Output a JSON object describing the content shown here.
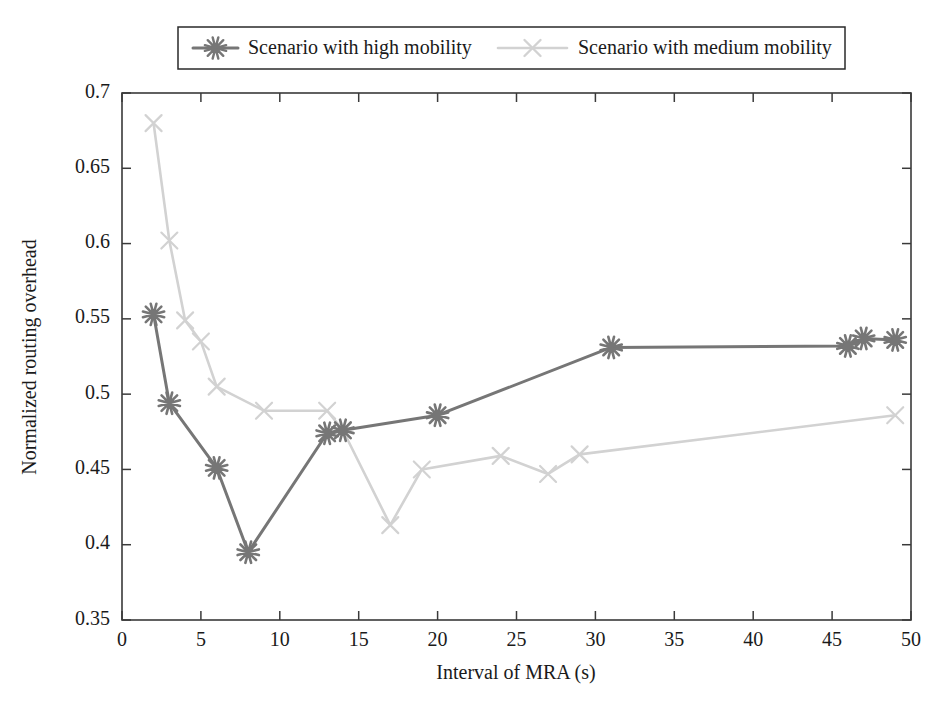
{
  "chart_data": {
    "type": "line",
    "title": "",
    "xlabel": "Interval of MRA (s)",
    "ylabel": "Normalized routing overhead",
    "xlim": [
      0,
      50
    ],
    "ylim": [
      0.35,
      0.7
    ],
    "xticks": [
      0,
      5,
      10,
      15,
      20,
      25,
      30,
      35,
      40,
      45,
      50
    ],
    "xtick_labels": [
      "0",
      "5",
      "10",
      "15",
      "20",
      "25",
      "30",
      "35",
      "40",
      "45",
      "50"
    ],
    "yticks": [
      0.35,
      0.4,
      0.45,
      0.5,
      0.55,
      0.6,
      0.65,
      0.7
    ],
    "ytick_labels": [
      "0.35",
      "0.4",
      "0.45",
      "0.5",
      "0.55",
      "0.6",
      "0.65",
      "0.7"
    ],
    "grid": false,
    "legend_position": "top-center",
    "series": [
      {
        "name": "Scenario with high mobility",
        "color": "#767676",
        "marker": "asterisk",
        "line_width": 3.0,
        "x": [
          2,
          3,
          6,
          8,
          13,
          14,
          20,
          31,
          46,
          47,
          49
        ],
        "y": [
          0.553,
          0.494,
          0.451,
          0.395,
          0.474,
          0.476,
          0.486,
          0.531,
          0.532,
          0.537,
          0.536
        ]
      },
      {
        "name": "Scenario with medium mobility",
        "color": "#d2d2d2",
        "marker": "cross",
        "line_width": 2.6,
        "x": [
          2,
          3,
          4,
          5,
          6,
          9,
          13,
          14,
          17,
          19,
          24,
          27,
          29,
          49
        ],
        "y": [
          0.68,
          0.602,
          0.549,
          0.535,
          0.505,
          0.489,
          0.489,
          0.476,
          0.413,
          0.45,
          0.459,
          0.447,
          0.46,
          0.486
        ]
      }
    ]
  },
  "legend": {
    "entries": [
      {
        "label": "Scenario with high mobility"
      },
      {
        "label": "Scenario with medium mobility"
      }
    ]
  }
}
